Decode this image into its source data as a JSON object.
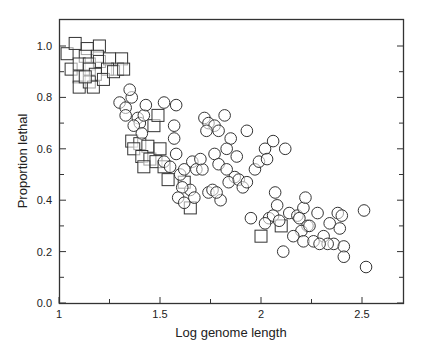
{
  "chart_data": {
    "type": "scatter",
    "title": "",
    "xlabel": "Log genome length",
    "ylabel": "Proportion lethal",
    "xlim": [
      1.0,
      2.7
    ],
    "ylim": [
      0.0,
      1.1
    ],
    "xticks": [
      1,
      1.5,
      2,
      2.5
    ],
    "xtick_labels": [
      "1",
      "1.5",
      "2",
      "2.5"
    ],
    "xminor_ticks": [
      1.25,
      1.75,
      2.25
    ],
    "yticks": [
      0.0,
      0.2,
      0.4,
      0.6,
      0.8,
      1.0
    ],
    "ytick_labels": [
      "0.0",
      "0.2",
      "0.4",
      "0.6",
      "0.8",
      "1.0"
    ],
    "yminor_ticks": [
      0.1,
      0.3,
      0.5,
      0.7,
      0.9
    ],
    "grid": false,
    "legend": null,
    "series": [
      {
        "name": "squares",
        "marker": "square",
        "points": [
          [
            1.04,
            0.97
          ],
          [
            1.08,
            1.01
          ],
          [
            1.14,
            0.99
          ],
          [
            1.2,
            1.0
          ],
          [
            1.13,
            0.96
          ],
          [
            1.19,
            0.96
          ],
          [
            1.06,
            0.91
          ],
          [
            1.1,
            0.93
          ],
          [
            1.15,
            0.93
          ],
          [
            1.2,
            0.94
          ],
          [
            1.25,
            0.95
          ],
          [
            1.31,
            0.95
          ],
          [
            1.29,
            0.91
          ],
          [
            1.24,
            0.91
          ],
          [
            1.1,
            0.88
          ],
          [
            1.15,
            0.91
          ],
          [
            1.18,
            0.89
          ],
          [
            1.1,
            0.84
          ],
          [
            1.15,
            0.86
          ],
          [
            1.17,
            0.84
          ],
          [
            1.22,
            0.87
          ],
          [
            1.27,
            0.9
          ],
          [
            1.32,
            0.91
          ],
          [
            1.13,
            0.88
          ],
          [
            1.36,
            0.63
          ],
          [
            1.4,
            0.62
          ],
          [
            1.37,
            0.6
          ],
          [
            1.44,
            0.61
          ],
          [
            1.41,
            0.57
          ],
          [
            1.45,
            0.56
          ],
          [
            1.48,
            0.55
          ],
          [
            1.52,
            0.53
          ],
          [
            1.54,
            0.48
          ],
          [
            1.65,
            0.37
          ],
          [
            1.47,
            0.69
          ],
          [
            1.49,
            0.73
          ],
          [
            1.42,
            0.53
          ],
          [
            1.5,
            0.6
          ],
          [
            1.62,
            0.47
          ],
          [
            2.0,
            0.26
          ],
          [
            2.1,
            0.3
          ]
        ]
      },
      {
        "name": "circles",
        "marker": "circle",
        "points": [
          [
            1.3,
            0.78
          ],
          [
            1.33,
            0.76
          ],
          [
            1.36,
            0.8
          ],
          [
            1.35,
            0.83
          ],
          [
            1.33,
            0.73
          ],
          [
            1.39,
            0.72
          ],
          [
            1.4,
            0.7
          ],
          [
            1.37,
            0.69
          ],
          [
            1.42,
            0.73
          ],
          [
            1.43,
            0.77
          ],
          [
            1.41,
            0.66
          ],
          [
            1.52,
            0.78
          ],
          [
            1.58,
            0.77
          ],
          [
            1.57,
            0.69
          ],
          [
            1.52,
            0.55
          ],
          [
            1.57,
            0.64
          ],
          [
            1.58,
            0.58
          ],
          [
            1.55,
            0.53
          ],
          [
            1.6,
            0.5
          ],
          [
            1.62,
            0.52
          ],
          [
            1.66,
            0.55
          ],
          [
            1.68,
            0.52
          ],
          [
            1.65,
            0.44
          ],
          [
            1.61,
            0.45
          ],
          [
            1.59,
            0.41
          ],
          [
            1.62,
            0.39
          ],
          [
            1.67,
            0.41
          ],
          [
            1.72,
            0.72
          ],
          [
            1.74,
            0.7
          ],
          [
            1.77,
            0.69
          ],
          [
            1.79,
            0.67
          ],
          [
            1.73,
            0.67
          ],
          [
            1.82,
            0.73
          ],
          [
            1.85,
            0.64
          ],
          [
            1.88,
            0.57
          ],
          [
            1.83,
            0.6
          ],
          [
            1.77,
            0.58
          ],
          [
            1.79,
            0.54
          ],
          [
            1.83,
            0.52
          ],
          [
            1.87,
            0.49
          ],
          [
            1.84,
            0.47
          ],
          [
            1.89,
            0.48
          ],
          [
            1.91,
            0.45
          ],
          [
            1.93,
            0.47
          ],
          [
            1.97,
            0.52
          ],
          [
            1.99,
            0.55
          ],
          [
            2.02,
            0.6
          ],
          [
            1.74,
            0.43
          ],
          [
            1.76,
            0.44
          ],
          [
            1.71,
            0.52
          ],
          [
            1.7,
            0.56
          ],
          [
            1.8,
            0.4
          ],
          [
            1.78,
            0.43
          ],
          [
            1.93,
            0.67
          ],
          [
            2.06,
            0.63
          ],
          [
            1.95,
            0.33
          ],
          [
            2.03,
            0.56
          ],
          [
            2.07,
            0.43
          ],
          [
            2.08,
            0.38
          ],
          [
            2.12,
            0.6
          ],
          [
            2.04,
            0.33
          ],
          [
            2.06,
            0.34
          ],
          [
            2.02,
            0.31
          ],
          [
            2.09,
            0.32
          ],
          [
            2.14,
            0.35
          ],
          [
            2.18,
            0.34
          ],
          [
            2.21,
            0.37
          ],
          [
            2.19,
            0.33
          ],
          [
            2.23,
            0.3
          ],
          [
            2.2,
            0.28
          ],
          [
            2.16,
            0.26
          ],
          [
            2.24,
            0.3
          ],
          [
            2.28,
            0.35
          ],
          [
            2.21,
            0.24
          ],
          [
            2.26,
            0.24
          ],
          [
            2.31,
            0.26
          ],
          [
            2.34,
            0.31
          ],
          [
            2.38,
            0.35
          ],
          [
            2.4,
            0.34
          ],
          [
            2.39,
            0.29
          ],
          [
            2.36,
            0.23
          ],
          [
            2.33,
            0.23
          ],
          [
            2.41,
            0.22
          ],
          [
            2.41,
            0.18
          ],
          [
            2.51,
            0.36
          ],
          [
            2.52,
            0.14
          ],
          [
            2.11,
            0.2
          ],
          [
            2.29,
            0.23
          ],
          [
            2.22,
            0.41
          ]
        ]
      }
    ]
  }
}
